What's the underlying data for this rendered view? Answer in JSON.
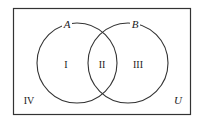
{
  "diagram": {
    "type": "venn",
    "universe_label": "U",
    "sets": [
      {
        "name": "A"
      },
      {
        "name": "B"
      }
    ],
    "regions": [
      {
        "label": "I",
        "description": "A only"
      },
      {
        "label": "II",
        "description": "A and B"
      },
      {
        "label": "III",
        "description": "B only"
      },
      {
        "label": "IV",
        "description": "neither A nor B"
      }
    ]
  }
}
